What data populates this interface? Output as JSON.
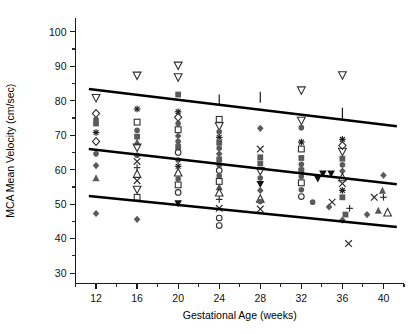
{
  "chart_data": {
    "type": "scatter",
    "title": "",
    "xlabel": "Gestational Age (weeks)",
    "ylabel": "MCA Mean Velocity (cm/sec)",
    "xlim": [
      10,
      42
    ],
    "ylim": [
      27,
      104
    ],
    "xticks": [
      12,
      16,
      20,
      24,
      28,
      32,
      36,
      40
    ],
    "yticks": [
      30,
      40,
      50,
      60,
      70,
      80,
      90,
      100
    ],
    "xtick_labels": [
      "12",
      "16",
      "20",
      "24",
      "28",
      "32",
      "36",
      "40"
    ],
    "ytick_labels": [
      "30",
      "40",
      "50",
      "60",
      "70",
      "80",
      "90",
      "100"
    ],
    "x_minor_step": 2,
    "y_minor_step": 5,
    "grid": false,
    "legend": null,
    "legend_position": "none",
    "marker_color_filled": "#555555",
    "marker_color_open": "#333333",
    "line_color": "#000000",
    "regression_lines": [
      {
        "name": "upper-95th-percentile",
        "x0": 11.3,
        "y0": 83.4,
        "x1": 41.3,
        "y1": 72.6
      },
      {
        "name": "mean-regression",
        "x0": 11.3,
        "y0": 66.0,
        "x1": 41.3,
        "y1": 55.8
      },
      {
        "name": "lower-5th-percentile",
        "x0": 11.3,
        "y0": 52.4,
        "x1": 41.3,
        "y1": 43.4
      }
    ],
    "error_bars": [
      {
        "x": 24.0,
        "y_top": 81.8,
        "y_bottom": 78.6
      },
      {
        "x": 28.0,
        "y_top": 82.6,
        "y_bottom": 79.4
      },
      {
        "x": 36.0,
        "y_top": 78.0,
        "y_bottom": 74.8
      }
    ],
    "points": [
      {
        "x": 12,
        "y": 80.8,
        "marker": "open-triangle-down"
      },
      {
        "x": 12,
        "y": 76.3,
        "marker": "open-diamond"
      },
      {
        "x": 12,
        "y": 74.6,
        "marker": "filled-circle"
      },
      {
        "x": 12,
        "y": 73.4,
        "marker": "filled-square"
      },
      {
        "x": 12,
        "y": 70.8,
        "marker": "asterisk"
      },
      {
        "x": 12,
        "y": 68.2,
        "marker": "open-diamond"
      },
      {
        "x": 12,
        "y": 64.6,
        "marker": "filled-circle"
      },
      {
        "x": 12,
        "y": 61.2,
        "marker": "filled-diamond"
      },
      {
        "x": 12,
        "y": 57.6,
        "marker": "filled-triangle-up"
      },
      {
        "x": 12,
        "y": 47.3,
        "marker": "filled-diamond"
      },
      {
        "x": 16,
        "y": 87.3,
        "marker": "open-triangle-down"
      },
      {
        "x": 16,
        "y": 77.6,
        "marker": "asterisk"
      },
      {
        "x": 16,
        "y": 73.8,
        "marker": "open-square"
      },
      {
        "x": 16,
        "y": 71.4,
        "marker": "filled-circle"
      },
      {
        "x": 16,
        "y": 69.6,
        "marker": "filled-square"
      },
      {
        "x": 16,
        "y": 68.0,
        "marker": "filled-triangle-up"
      },
      {
        "x": 16,
        "y": 66.4,
        "marker": "open-triangle-down"
      },
      {
        "x": 16,
        "y": 64.2,
        "marker": "filled-circle"
      },
      {
        "x": 16,
        "y": 62.4,
        "marker": "cross-x"
      },
      {
        "x": 16,
        "y": 60.6,
        "marker": "plus"
      },
      {
        "x": 16,
        "y": 58.8,
        "marker": "open-triangle-up"
      },
      {
        "x": 16,
        "y": 56.8,
        "marker": "cross-x"
      },
      {
        "x": 16,
        "y": 54.2,
        "marker": "open-triangle-down"
      },
      {
        "x": 16,
        "y": 52.0,
        "marker": "open-square"
      },
      {
        "x": 16,
        "y": 45.6,
        "marker": "filled-diamond"
      },
      {
        "x": 20,
        "y": 90.2,
        "marker": "open-triangle-down"
      },
      {
        "x": 20,
        "y": 86.8,
        "marker": "open-triangle-down"
      },
      {
        "x": 20,
        "y": 81.8,
        "marker": "filled-square"
      },
      {
        "x": 20,
        "y": 76.8,
        "marker": "asterisk"
      },
      {
        "x": 20,
        "y": 75.2,
        "marker": "open-diamond"
      },
      {
        "x": 20,
        "y": 73.4,
        "marker": "filled-circle"
      },
      {
        "x": 20,
        "y": 71.6,
        "marker": "open-square"
      },
      {
        "x": 20,
        "y": 69.8,
        "marker": "filled-diamond"
      },
      {
        "x": 20,
        "y": 68.2,
        "marker": "filled-circle"
      },
      {
        "x": 20,
        "y": 66.6,
        "marker": "filled-square"
      },
      {
        "x": 20,
        "y": 65.0,
        "marker": "open-circle"
      },
      {
        "x": 20,
        "y": 62.8,
        "marker": "filled-circle"
      },
      {
        "x": 20,
        "y": 61.0,
        "marker": "asterisk"
      },
      {
        "x": 20,
        "y": 59.2,
        "marker": "open-triangle-up"
      },
      {
        "x": 20,
        "y": 57.4,
        "marker": "filled-circle"
      },
      {
        "x": 20,
        "y": 55.6,
        "marker": "open-square"
      },
      {
        "x": 20,
        "y": 53.4,
        "marker": "open-circle"
      },
      {
        "x": 20,
        "y": 50.2,
        "marker": "filled-triangle-down"
      },
      {
        "x": 24,
        "y": 74.6,
        "marker": "open-square"
      },
      {
        "x": 24,
        "y": 72.6,
        "marker": "open-triangle-down"
      },
      {
        "x": 24,
        "y": 71.0,
        "marker": "filled-circle"
      },
      {
        "x": 24,
        "y": 69.4,
        "marker": "asterisk"
      },
      {
        "x": 24,
        "y": 67.8,
        "marker": "filled-square"
      },
      {
        "x": 24,
        "y": 66.2,
        "marker": "filled-circle"
      },
      {
        "x": 24,
        "y": 64.6,
        "marker": "filled-diamond"
      },
      {
        "x": 24,
        "y": 63.0,
        "marker": "filled-square"
      },
      {
        "x": 24,
        "y": 61.4,
        "marker": "filled-circle"
      },
      {
        "x": 24,
        "y": 59.8,
        "marker": "open-circle"
      },
      {
        "x": 24,
        "y": 58.2,
        "marker": "filled-circle"
      },
      {
        "x": 24,
        "y": 56.6,
        "marker": "open-square"
      },
      {
        "x": 24,
        "y": 55.0,
        "marker": "filled-triangle-up"
      },
      {
        "x": 24,
        "y": 53.4,
        "marker": "open-triangle-up"
      },
      {
        "x": 24,
        "y": 51.4,
        "marker": "plus"
      },
      {
        "x": 24,
        "y": 48.8,
        "marker": "cross-x"
      },
      {
        "x": 24,
        "y": 46.0,
        "marker": "open-circle"
      },
      {
        "x": 24,
        "y": 43.8,
        "marker": "open-circle"
      },
      {
        "x": 28,
        "y": 72.0,
        "marker": "filled-diamond"
      },
      {
        "x": 28,
        "y": 66.0,
        "marker": "cross-x"
      },
      {
        "x": 28,
        "y": 63.6,
        "marker": "filled-square"
      },
      {
        "x": 28,
        "y": 61.8,
        "marker": "filled-square"
      },
      {
        "x": 28,
        "y": 59.6,
        "marker": "open-triangle-down"
      },
      {
        "x": 28,
        "y": 57.6,
        "marker": "filled-circle"
      },
      {
        "x": 28,
        "y": 55.8,
        "marker": "filled-triangle-down"
      },
      {
        "x": 28,
        "y": 54.0,
        "marker": "filled-diamond"
      },
      {
        "x": 28,
        "y": 51.6,
        "marker": "open-triangle-up"
      },
      {
        "x": 28,
        "y": 50.8,
        "marker": "filled-circle"
      },
      {
        "x": 28,
        "y": 48.6,
        "marker": "cross-x"
      },
      {
        "x": 32,
        "y": 83.0,
        "marker": "open-triangle-down"
      },
      {
        "x": 32,
        "y": 74.2,
        "marker": "open-triangle-down"
      },
      {
        "x": 32,
        "y": 72.2,
        "marker": "filled-circle"
      },
      {
        "x": 32,
        "y": 68.0,
        "marker": "asterisk"
      },
      {
        "x": 32,
        "y": 66.0,
        "marker": "open-square"
      },
      {
        "x": 32,
        "y": 63.4,
        "marker": "filled-square"
      },
      {
        "x": 32,
        "y": 61.6,
        "marker": "filled-circle"
      },
      {
        "x": 32,
        "y": 59.8,
        "marker": "filled-square"
      },
      {
        "x": 32,
        "y": 58.0,
        "marker": "filled-circle"
      },
      {
        "x": 32,
        "y": 56.2,
        "marker": "open-square"
      },
      {
        "x": 32,
        "y": 54.2,
        "marker": "filled-circle"
      },
      {
        "x": 32,
        "y": 52.2,
        "marker": "open-circle"
      },
      {
        "x": 32,
        "y": 60.0,
        "marker": "filled-circle"
      },
      {
        "x": 33.1,
        "y": 50.6,
        "marker": "filled-circle"
      },
      {
        "x": 36,
        "y": 87.4,
        "marker": "open-triangle-down"
      },
      {
        "x": 36,
        "y": 68.8,
        "marker": "asterisk"
      },
      {
        "x": 36,
        "y": 67.0,
        "marker": "open-diamond"
      },
      {
        "x": 36,
        "y": 65.2,
        "marker": "open-triangle-down"
      },
      {
        "x": 36,
        "y": 63.2,
        "marker": "filled-square"
      },
      {
        "x": 36,
        "y": 61.4,
        "marker": "filled-circle"
      },
      {
        "x": 36,
        "y": 59.6,
        "marker": "filled-diamond"
      },
      {
        "x": 36,
        "y": 57.8,
        "marker": "open-triangle-up"
      },
      {
        "x": 36,
        "y": 56.0,
        "marker": "cross-x"
      },
      {
        "x": 36,
        "y": 54.0,
        "marker": "asterisk"
      },
      {
        "x": 36,
        "y": 52.0,
        "marker": "filled-square"
      },
      {
        "x": 35.0,
        "y": 50.6,
        "marker": "cross-x"
      },
      {
        "x": 34.7,
        "y": 49.2,
        "marker": "filled-diamond"
      },
      {
        "x": 36.7,
        "y": 48.8,
        "marker": "plus"
      },
      {
        "x": 36.3,
        "y": 47.0,
        "marker": "filled-square"
      },
      {
        "x": 36.0,
        "y": 45.4,
        "marker": "filled-diamond"
      },
      {
        "x": 36.6,
        "y": 38.6,
        "marker": "cross-x"
      },
      {
        "x": 34.1,
        "y": 58.8,
        "marker": "filled-triangle-down"
      },
      {
        "x": 34.9,
        "y": 58.8,
        "marker": "filled-triangle-down"
      },
      {
        "x": 33.6,
        "y": 57.4,
        "marker": "filled-triangle-down"
      },
      {
        "x": 40,
        "y": 58.4,
        "marker": "filled-diamond"
      },
      {
        "x": 39.9,
        "y": 54.0,
        "marker": "filled-triangle-up"
      },
      {
        "x": 40.0,
        "y": 52.0,
        "marker": "plus"
      },
      {
        "x": 39.1,
        "y": 52.0,
        "marker": "cross-x"
      },
      {
        "x": 39.5,
        "y": 48.2,
        "marker": "filled-triangle-up"
      },
      {
        "x": 40.4,
        "y": 47.6,
        "marker": "open-triangle-up"
      },
      {
        "x": 38.4,
        "y": 47.0,
        "marker": "filled-diamond"
      }
    ]
  }
}
